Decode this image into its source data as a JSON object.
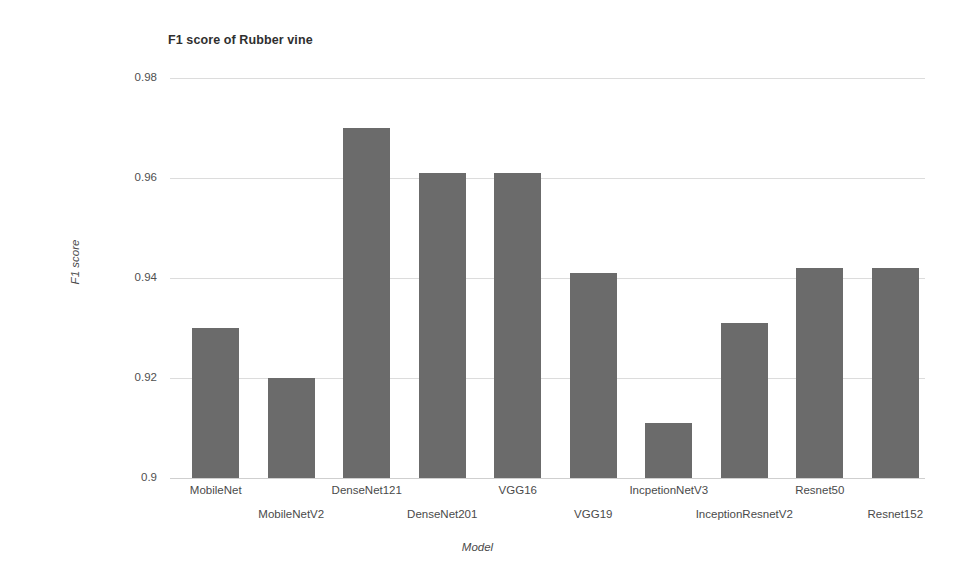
{
  "chart_data": {
    "type": "bar",
    "title": "F1 score of Rubber vine",
    "xlabel": "Model",
    "ylabel": "F1 score",
    "categories": [
      "MobileNet",
      "MobileNetV2",
      "DenseNet121",
      "DenseNet201",
      "VGG16",
      "VGG19",
      "IncpetionNetV3",
      "InceptionResnetV2",
      "Resnet50",
      "Resnet152"
    ],
    "values": [
      0.93,
      0.92,
      0.97,
      0.961,
      0.961,
      0.941,
      0.911,
      0.931,
      0.942,
      0.942
    ],
    "ylim": [
      0.9,
      0.98
    ],
    "yticks": [
      0.9,
      0.92,
      0.94,
      0.96,
      0.98
    ],
    "ytick_labels": [
      "0.9",
      "0.92",
      "0.94",
      "0.96",
      "0.98"
    ],
    "grid": true,
    "legend": false,
    "legend_position": "none",
    "bar_color": "#6b6b6b",
    "gridline_color": "#dcdcdc",
    "background_color": "#ffffff"
  }
}
